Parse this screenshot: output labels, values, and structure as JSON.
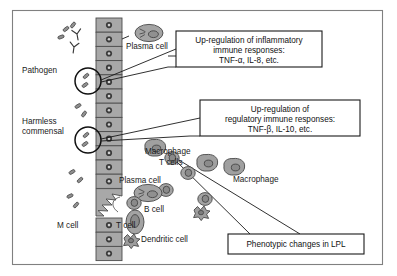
{
  "figure": {
    "frame": {
      "border_color": "#808080",
      "background": "#ffffff",
      "x": 12,
      "y": 10,
      "width": 371,
      "height": 255
    },
    "palette": {
      "cell_fill": "#a8a8a8",
      "cell_stroke": "#4d4d4d",
      "nucleus_fill": "#3d3d3d",
      "lumen_cell_fill": "#9a9a9a",
      "line": "#1a1a1a",
      "box_border": "#1a1a1a",
      "box_fill": "#ffffff"
    }
  },
  "callout_boxes": [
    {
      "id": "inflammatory",
      "lines": [
        "Up-regulation of inflammatory",
        "immune responses:",
        "TNF-α, IL-8, etc."
      ],
      "x": 176,
      "y": 31,
      "width": 146,
      "height": 36
    },
    {
      "id": "regulatory",
      "lines": [
        "Up-regulation of",
        "regulatory immune responses:",
        "TNF-β, IL-10, etc."
      ],
      "x": 200,
      "y": 100,
      "width": 160,
      "height": 36
    },
    {
      "id": "phenotypic",
      "lines": [
        "Phenotypic changes in LPL"
      ],
      "x": 228,
      "y": 234,
      "width": 136,
      "height": 20
    }
  ],
  "labels": [
    {
      "id": "pathogen",
      "text": "Pathogen",
      "x": 22,
      "y": 73,
      "anchor": "start"
    },
    {
      "id": "harmless-1",
      "text": "Harmless",
      "x": 22,
      "y": 124,
      "anchor": "start"
    },
    {
      "id": "harmless-2",
      "text": "commensal",
      "x": 22,
      "y": 134,
      "anchor": "start"
    },
    {
      "id": "plasma-cell-top",
      "text": "Plasma cell",
      "x": 126,
      "y": 49,
      "anchor": "start"
    },
    {
      "id": "macrophage-left",
      "text": "Macrophage",
      "x": 145,
      "y": 154,
      "anchor": "start"
    },
    {
      "id": "t-cells",
      "text": "T cells",
      "x": 159,
      "y": 165,
      "anchor": "start"
    },
    {
      "id": "macrophage-right",
      "text": "Macrophage",
      "x": 233,
      "y": 182,
      "anchor": "start"
    },
    {
      "id": "plasma-cell-low",
      "text": "Plasma cell",
      "x": 119,
      "y": 183,
      "anchor": "start"
    },
    {
      "id": "b-cell",
      "text": "B cell",
      "x": 144,
      "y": 212,
      "anchor": "start"
    },
    {
      "id": "m-cell",
      "text": "M cell",
      "x": 57,
      "y": 228,
      "anchor": "start"
    },
    {
      "id": "t-cell",
      "text": "T cell",
      "x": 116,
      "y": 228,
      "anchor": "start"
    },
    {
      "id": "dendritic-cell",
      "text": "Dendritic cell",
      "x": 141,
      "y": 242,
      "anchor": "start"
    }
  ],
  "epithelium": {
    "description": "Vertical column of columnar epithelial cells with nuclei forming the mucosal barrier",
    "x": 96,
    "top": 18,
    "cell_width": 26,
    "cell_height": 14.2,
    "cell_count": 16
  },
  "magnifier_circles": [
    {
      "id": "pathogen-zoom",
      "cx": 88,
      "cy": 81,
      "r": 13
    },
    {
      "id": "commensal-zoom",
      "cx": 88,
      "cy": 140,
      "r": 13
    }
  ],
  "antibodies": {
    "count": 2,
    "description": "Y-shaped secretory IgA molecules in the lumen",
    "positions": [
      {
        "x": 76,
        "y": 33
      },
      {
        "x": 74,
        "y": 45
      }
    ]
  },
  "microbes": {
    "lumen_pathogens": 3,
    "lumen_commensals": 6,
    "description": "Small rod and oval shaped bacteria in the lumen"
  }
}
